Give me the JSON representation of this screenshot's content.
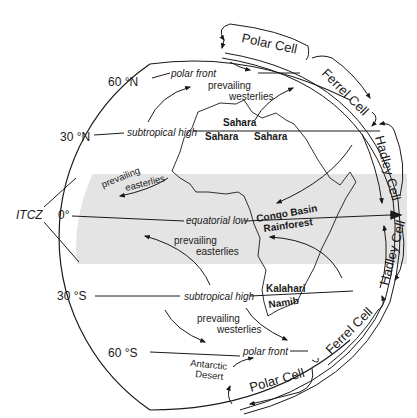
{
  "diagram": {
    "type": "global atmospheric circulation",
    "latitudes": {
      "n60": "60 °N",
      "n30": "30 °N",
      "eq": "0°",
      "s30": "30 °S",
      "s60": "60 °S"
    },
    "itcz": "ITCZ",
    "pressure_belts": {
      "polar_front_n": "polar front",
      "subtropical_high_n": "subtropical high",
      "equatorial_low": "equatorial low",
      "subtropical_high_s": "subtropical high",
      "polar_front_s": "polar front"
    },
    "winds": {
      "westerlies_n_1": "prevailing",
      "westerlies_n_2": "westerlies",
      "easterlies_n_1": "prevailing",
      "easterlies_n_2": "easterlies",
      "easterlies_s_1": "prevailing",
      "easterlies_s_2": "easterlies",
      "westerlies_s_1": "prevailing",
      "westerlies_s_2": "westerlies"
    },
    "regions": {
      "sahara_1": "Sahara",
      "sahara_2": "Sahara",
      "sahara_3": "Sahara",
      "congo_1": "Congo Basin",
      "congo_2": "Rainforest",
      "kalahari": "Kalahari",
      "namib": "Namib",
      "antarctic_1": "Antarctic",
      "antarctic_2": "Desert"
    },
    "cells": {
      "polar_n": "Polar Cell",
      "ferrel_n": "Ferrel Cell",
      "hadley_n": "Hadley Cell",
      "hadley_s": "Hadley Cell",
      "ferrel_s": "Ferrel Cell",
      "polar_s": "Polar Cell"
    },
    "colors": {
      "tropics_band": "#e4e4e4",
      "ink": "#1a1a1a"
    }
  }
}
